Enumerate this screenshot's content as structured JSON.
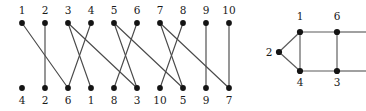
{
  "figure": {
    "width": 366,
    "height": 111,
    "background": "#ffffff",
    "edge_color": "#4a4a4a",
    "node_color": "#141414",
    "label_color": "#1a1a1a"
  },
  "left_graph": {
    "name": "bipartite-permutation-diagram",
    "top_row": {
      "y": 23,
      "label_y": 14,
      "start_x": 22,
      "spacing": 23,
      "labels": [
        "1",
        "2",
        "3",
        "4",
        "5",
        "6",
        "7",
        "8",
        "9",
        "10"
      ]
    },
    "bottom_row": {
      "y": 88,
      "label_y": 104,
      "start_x": 22,
      "spacing": 23,
      "labels": [
        "4",
        "2",
        "6",
        "1",
        "8",
        "3",
        "10",
        "5",
        "9",
        "7"
      ]
    },
    "node_radius": 2.9,
    "edges": [
      {
        "top_index": 0,
        "bottom_index": 2
      },
      {
        "top_index": 1,
        "bottom_index": 1
      },
      {
        "top_index": 2,
        "bottom_index": 3
      },
      {
        "top_index": 3,
        "bottom_index": 2
      },
      {
        "top_index": 4,
        "bottom_index": 5
      },
      {
        "top_index": 5,
        "bottom_index": 4
      },
      {
        "top_index": 6,
        "bottom_index": 7
      },
      {
        "top_index": 7,
        "bottom_index": 6
      },
      {
        "top_index": 8,
        "bottom_index": 8
      },
      {
        "top_index": 9,
        "bottom_index": 9
      }
    ],
    "long_edges": [
      {
        "top_index": 2,
        "bottom_index": 5
      },
      {
        "top_index": 4,
        "bottom_index": 7
      },
      {
        "top_index": 6,
        "bottom_index": 9
      }
    ]
  },
  "right_graph": {
    "name": "clipped-lattice-graph",
    "node_radius": 3.1,
    "clip_x": 366,
    "nodes": [
      {
        "id": "n2",
        "label": "2",
        "x": 279,
        "y": 52,
        "label_x": 269,
        "label_y": 56
      },
      {
        "id": "n1",
        "label": "1",
        "x": 300,
        "y": 32,
        "label_x": 300,
        "label_y": 20
      },
      {
        "id": "n4",
        "label": "4",
        "x": 300,
        "y": 71,
        "label_x": 300,
        "label_y": 86
      },
      {
        "id": "n6",
        "label": "6",
        "x": 337,
        "y": 32,
        "label_x": 337,
        "label_y": 20
      },
      {
        "id": "n3",
        "label": "3",
        "x": 337,
        "y": 71,
        "label_x": 337,
        "label_y": 86
      }
    ],
    "edges": [
      {
        "from": "n2",
        "to": "n1"
      },
      {
        "from": "n2",
        "to": "n4"
      },
      {
        "from": "n1",
        "to": "n4"
      },
      {
        "from": "n1",
        "to": "n6"
      },
      {
        "from": "n4",
        "to": "n3"
      },
      {
        "from": "n6",
        "to": "n3"
      }
    ],
    "clipped_edges": [
      {
        "from": "n6",
        "to_x": 366,
        "to_y": 32
      },
      {
        "from": "n3",
        "to_x": 366,
        "to_y": 71
      }
    ]
  }
}
